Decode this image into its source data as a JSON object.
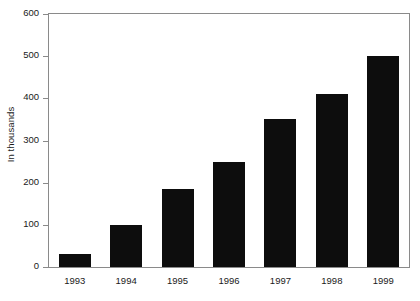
{
  "chart_data": {
    "type": "bar",
    "title": "",
    "subtitle": "",
    "xlabel": "",
    "ylabel": "In thousands",
    "categories": [
      "1993",
      "1994",
      "1995",
      "1996",
      "1997",
      "1998",
      "1999"
    ],
    "values": [
      30,
      100,
      185,
      250,
      350,
      410,
      500
    ],
    "series": [
      {
        "name": "",
        "values": [
          30,
          100,
          185,
          250,
          350,
          410,
          500
        ]
      }
    ],
    "ylim": [
      0,
      600
    ],
    "y_ticks": [
      "0",
      "100",
      "200",
      "300",
      "400",
      "500",
      "600"
    ],
    "y_tick_values": [
      0,
      100,
      200,
      300,
      400,
      500,
      600
    ],
    "grid": false,
    "legend": false,
    "legend_position": "none",
    "bar_color": "#0d0d0d",
    "background_color": "#ffffff",
    "axis_color": "#8a8a8a",
    "text_color": "#1a1a1a"
  }
}
